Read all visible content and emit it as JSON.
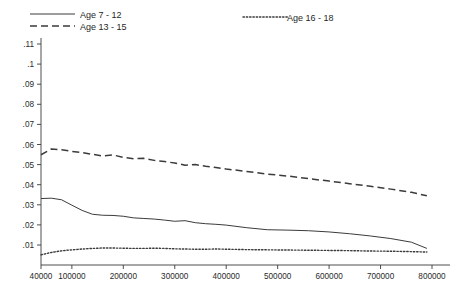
{
  "chart_data": {
    "type": "line",
    "title": "",
    "subtitle": "",
    "xlabel": "",
    "ylabel": "",
    "grid": false,
    "legend_position": "top",
    "xlim": [
      40000,
      800000
    ],
    "ylim": [
      0,
      0.115
    ],
    "x_tick_labels": [
      "40000",
      "100000",
      "200000",
      "300000",
      "400000",
      "500000",
      "600000",
      "700000",
      "800000"
    ],
    "x_tick_values": [
      40000,
      100000,
      200000,
      300000,
      400000,
      500000,
      600000,
      700000,
      800000
    ],
    "y_tick_labels": [
      ".01",
      ".02",
      ".03",
      ".04",
      ".05",
      ".06",
      ".07",
      ".08",
      ".09",
      ".1",
      ".11"
    ],
    "y_tick_values": [
      0.01,
      0.02,
      0.03,
      0.04,
      0.05,
      0.06,
      0.07,
      0.08,
      0.09,
      0.1,
      0.11
    ],
    "series": [
      {
        "name": "Age 7 - 12",
        "style": "solid",
        "color": "#3b3b3b",
        "x": [
          40000,
          60000,
          80000,
          100000,
          120000,
          140000,
          160000,
          180000,
          200000,
          220000,
          240000,
          260000,
          280000,
          300000,
          320000,
          340000,
          360000,
          380000,
          400000,
          440000,
          480000,
          520000,
          560000,
          600000,
          640000,
          680000,
          720000,
          760000,
          790000
        ],
        "values": [
          0.0331,
          0.0333,
          0.0325,
          0.0298,
          0.0272,
          0.0253,
          0.0248,
          0.0247,
          0.0243,
          0.0235,
          0.0232,
          0.0229,
          0.0224,
          0.0218,
          0.0221,
          0.0211,
          0.0206,
          0.0203,
          0.0199,
          0.0186,
          0.0176,
          0.0174,
          0.0171,
          0.0165,
          0.0156,
          0.0145,
          0.0132,
          0.0114,
          0.0083
        ]
      },
      {
        "name": "Age 13 - 15",
        "style": "dashed",
        "color": "#3b3b3b",
        "x": [
          40000,
          60000,
          80000,
          100000,
          120000,
          140000,
          160000,
          180000,
          200000,
          220000,
          240000,
          260000,
          280000,
          300000,
          320000,
          340000,
          360000,
          380000,
          400000,
          440000,
          480000,
          520000,
          560000,
          600000,
          640000,
          680000,
          720000,
          760000,
          790000
        ],
        "values": [
          0.0549,
          0.0578,
          0.0574,
          0.0566,
          0.056,
          0.0551,
          0.0543,
          0.0548,
          0.0536,
          0.0529,
          0.0531,
          0.0521,
          0.0515,
          0.0508,
          0.0497,
          0.05,
          0.0492,
          0.0486,
          0.0478,
          0.0466,
          0.0453,
          0.0443,
          0.043,
          0.0418,
          0.0405,
          0.0392,
          0.0378,
          0.0362,
          0.0345
        ]
      },
      {
        "name": "Age 16 - 18",
        "style": "dotted",
        "color": "#3b3b3b",
        "x": [
          40000,
          60000,
          80000,
          100000,
          120000,
          140000,
          160000,
          180000,
          200000,
          220000,
          240000,
          260000,
          280000,
          300000,
          320000,
          340000,
          360000,
          380000,
          400000,
          440000,
          480000,
          520000,
          560000,
          600000,
          640000,
          680000,
          720000,
          760000,
          790000
        ],
        "values": [
          0.0051,
          0.0063,
          0.0071,
          0.0076,
          0.008,
          0.0083,
          0.0085,
          0.0085,
          0.0084,
          0.0083,
          0.0083,
          0.0084,
          0.0083,
          0.0081,
          0.008,
          0.0079,
          0.0079,
          0.008,
          0.0079,
          0.0077,
          0.0076,
          0.0075,
          0.0074,
          0.0073,
          0.0072,
          0.007,
          0.0069,
          0.0067,
          0.0065
        ]
      }
    ]
  },
  "legend": {
    "entries": [
      {
        "label": "Age 7 - 12",
        "style": "solid"
      },
      {
        "label": "Age 13 - 15",
        "style": "dashed"
      },
      {
        "label": "Age 16 - 18",
        "style": "dotted"
      }
    ]
  }
}
